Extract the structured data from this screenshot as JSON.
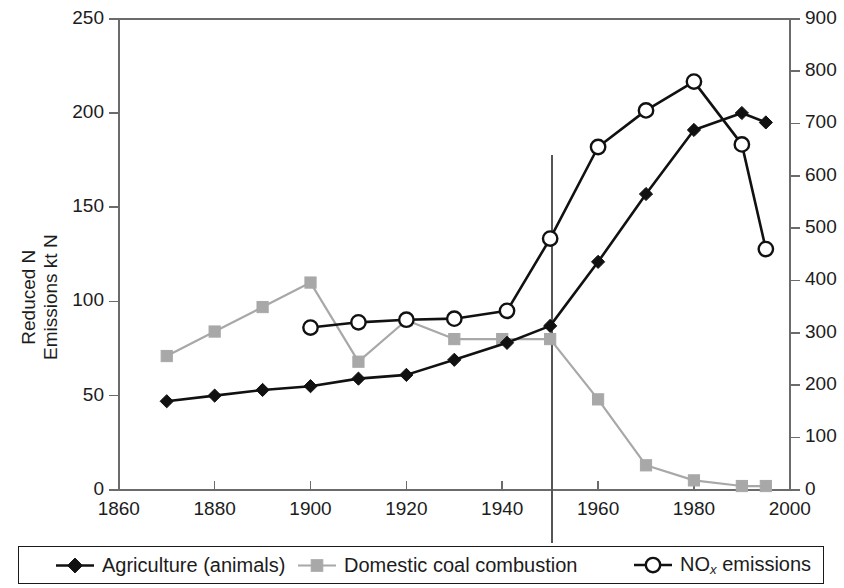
{
  "chart_data": {
    "type": "line",
    "title": "",
    "xlabel": "",
    "ylabel": "Reduced N Emissions kt N",
    "ylabel_line1": "Reduced N",
    "ylabel_line2": "Emissions kt N",
    "y2label": "",
    "xlim": [
      1860,
      2000
    ],
    "ylim": [
      0,
      250
    ],
    "y2lim": [
      0,
      900
    ],
    "xticks": [
      1860,
      1880,
      1900,
      1920,
      1940,
      1960,
      1980,
      2000
    ],
    "yticks": [
      0,
      50,
      100,
      150,
      200,
      250
    ],
    "y2ticks": [
      0,
      100,
      200,
      300,
      400,
      500,
      600,
      700,
      800,
      900
    ],
    "grid": false,
    "legend_position": "bottom",
    "annotations": [
      {
        "type": "vertical-line",
        "x": 1950,
        "label": ""
      }
    ],
    "series": [
      {
        "name": "Agriculture (animals)",
        "axis": "left",
        "marker": "filled-diamond",
        "color": "#111111",
        "x": [
          1870,
          1880,
          1890,
          1900,
          1910,
          1920,
          1930,
          1941,
          1950,
          1960,
          1970,
          1980,
          1990,
          1995
        ],
        "values": [
          47,
          50,
          53,
          55,
          59,
          61,
          69,
          78,
          87,
          121,
          157,
          191,
          200,
          195
        ]
      },
      {
        "name": "Domestic coal combustion",
        "axis": "left",
        "marker": "filled-square",
        "color": "#a8a8a8",
        "x": [
          1870,
          1880,
          1890,
          1900,
          1910,
          1920,
          1930,
          1940,
          1950,
          1960,
          1970,
          1980,
          1990,
          1995
        ],
        "values": [
          71,
          84,
          97,
          110,
          68,
          90,
          80,
          80,
          80,
          48,
          13,
          5,
          2,
          2
        ]
      },
      {
        "name": "NOx emissions",
        "axis": "right",
        "marker": "open-circle",
        "color": "#111111",
        "x": [
          1900,
          1910,
          1920,
          1930,
          1941,
          1950,
          1960,
          1970,
          1980,
          1990,
          1995
        ],
        "values": [
          310,
          320,
          325,
          327,
          342,
          480,
          655,
          725,
          780,
          660,
          460
        ]
      }
    ]
  },
  "legend": {
    "items": [
      {
        "label": "Agriculture (animals)",
        "marker": "filled-diamond",
        "color": "#111111"
      },
      {
        "label": "Domestic coal combustion",
        "marker": "filled-square",
        "color": "#a8a8a8"
      },
      {
        "label_pre": "NO",
        "label_sub": "x",
        "label_post": " emissions",
        "marker": "open-circle",
        "color": "#111111"
      }
    ]
  },
  "colors": {
    "agriculture": "#111111",
    "coal": "#a8a8a8",
    "nox": "#111111",
    "axis": "#6b6b6b",
    "text": "#1c1c1c"
  }
}
